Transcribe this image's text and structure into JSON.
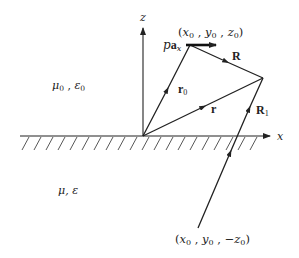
{
  "diagram": {
    "type": "electromagnetic image-method geometry",
    "regions": {
      "upper": {
        "label_mu": "μ",
        "sub_mu": "0",
        "sep": " , ",
        "label_eps": "ε",
        "sub_eps": "0"
      },
      "lower": {
        "label": "μ, ε"
      }
    },
    "axes": {
      "z": {
        "label": "z"
      },
      "x": {
        "label": "x"
      }
    },
    "source_point": {
      "open": "(",
      "x": "x",
      "x_sub": "0",
      "sep1": " , ",
      "y": "y",
      "y_sub": "0",
      "sep2": " , ",
      "z": "z",
      "z_sub": "0",
      "close": ")"
    },
    "image_point": {
      "open": "(",
      "x": "x",
      "x_sub": "0",
      "sep1": " , ",
      "y": "y",
      "y_sub": "0",
      "sep2": " , ",
      "z": "−z",
      "z_sub": "0",
      "close": ")"
    },
    "dipole": {
      "p": "p",
      "a": "a",
      "a_sub": "x"
    },
    "vectors": {
      "r0": {
        "label": "r",
        "sub": "0"
      },
      "r": {
        "label": "r"
      },
      "R": {
        "label": "R"
      },
      "R1": {
        "label": "R",
        "sub": "1"
      }
    },
    "colors": {
      "ink": "#222222",
      "background": "#ffffff"
    }
  }
}
